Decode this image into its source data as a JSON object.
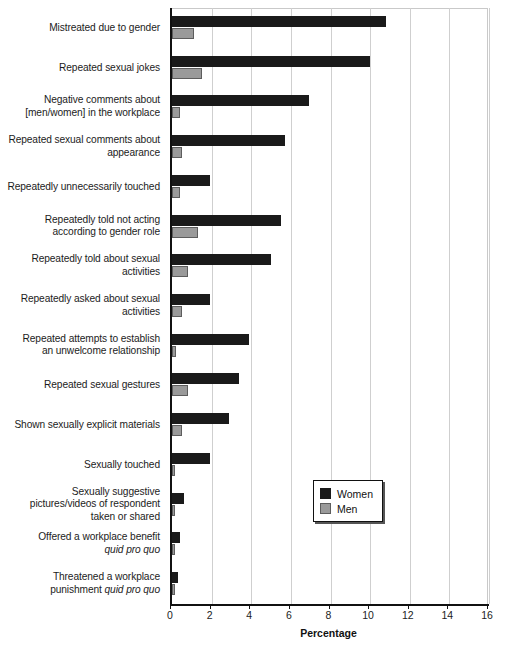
{
  "chart_data": {
    "type": "bar",
    "orientation": "horizontal",
    "title": "",
    "xlabel": "Percentage",
    "ylabel": "",
    "xlim": [
      0,
      16
    ],
    "xticks": [
      0,
      2,
      4,
      6,
      8,
      10,
      12,
      14,
      16
    ],
    "grid": true,
    "legend_position": "middle-right-inside",
    "categories": [
      "Mistreated due to gender",
      "Repeated sexual jokes",
      "Negative comments about\n[men/women] in the workplace",
      "Repeated sexual comments about\nappearance",
      "Repeatedly unnecessarily touched",
      "Repeatedly told not acting\naccording to gender role",
      "Repeatedly told about sexual\nactivities",
      "Repeatedly asked about sexual\nactivities",
      "Repeated attempts to establish\nan unwelcome relationship",
      "Repeated sexual gestures",
      "Shown sexually explicit materials",
      "Sexually touched",
      "Sexually suggestive\npictures/videos of respondent\ntaken or shared",
      "Offered a workplace benefit\nquid pro quo",
      "Threatened a workplace\npunishment quid pro quo"
    ],
    "series": [
      {
        "name": "Women",
        "color": "#1a1a1a",
        "values": [
          10.8,
          10.0,
          6.9,
          5.7,
          1.9,
          5.5,
          5.0,
          1.9,
          3.9,
          3.4,
          2.9,
          1.9,
          0.6,
          0.4,
          0.3
        ]
      },
      {
        "name": "Men",
        "color": "#9a9a9a",
        "values": [
          1.1,
          1.5,
          0.4,
          0.5,
          0.4,
          1.3,
          0.8,
          0.5,
          0.2,
          0.8,
          0.5,
          0.15,
          0.1,
          0.05,
          0.05
        ]
      }
    ]
  },
  "legend": {
    "items": [
      {
        "label": "Women",
        "swatch": "women"
      },
      {
        "label": "Men",
        "swatch": "men"
      }
    ]
  },
  "axis": {
    "x_title": "Percentage"
  }
}
